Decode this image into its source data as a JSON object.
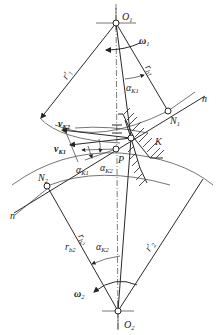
{
  "diagram": {
    "points": {
      "O1": {
        "label": "O",
        "sub": "1"
      },
      "O2": {
        "label": "O",
        "sub": "2"
      },
      "N1": {
        "label": "N",
        "sub": "1"
      },
      "N2": {
        "label": "N",
        "sub": "2"
      },
      "P": {
        "label": "P",
        "sub": ""
      },
      "K": {
        "label": "K",
        "sub": ""
      }
    },
    "labels": {
      "omega1": {
        "label": "ω",
        "sub": "1"
      },
      "omega2": {
        "label": "ω",
        "sub": "2"
      },
      "r1_prime": {
        "label": "r′",
        "sub": "1"
      },
      "r2_prime": {
        "label": "r′",
        "sub": "2"
      },
      "rb1": {
        "label": "r",
        "sub": "b1"
      },
      "rb2": {
        "label": "r",
        "sub": "b2"
      },
      "rb2_b": {
        "label": "r",
        "sub": "b2"
      },
      "alphaK1_top": {
        "label": "α",
        "sub": "K1"
      },
      "alphaK1_mid": {
        "label": "α",
        "sub": "K1"
      },
      "alphaK2_mid": {
        "label": "α",
        "sub": "K2"
      },
      "alphaK2_bot": {
        "label": "α",
        "sub": "K2"
      },
      "vK1": {
        "label": "v",
        "sub": "K1"
      },
      "vK2": {
        "label": "v",
        "sub": "K2"
      },
      "n_top": {
        "label": "n",
        "sub": ""
      },
      "n_bottom": {
        "label": "n",
        "sub": ""
      }
    }
  }
}
